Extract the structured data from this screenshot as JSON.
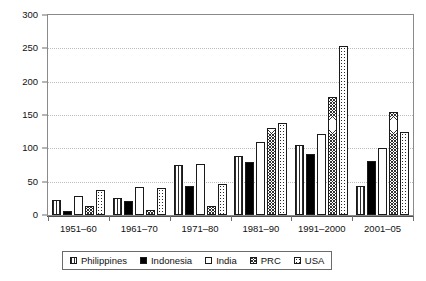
{
  "chart_data": {
    "type": "bar",
    "title": "",
    "xlabel": "",
    "ylabel": "",
    "ylim": [
      0,
      300
    ],
    "yticks": [
      0,
      50,
      100,
      150,
      200,
      250,
      300
    ],
    "ytick_labels": [
      "0",
      "50",
      "100",
      "150",
      "200",
      "250",
      "300"
    ],
    "grid": true,
    "legend_position": "bottom",
    "categories": [
      "1951–60",
      "1961–70",
      "1971–80",
      "1981–90",
      "1991–2000",
      "2001–05"
    ],
    "series": [
      {
        "name": "Philippines",
        "pattern": "vertical-lines",
        "values": [
          22,
          25,
          75,
          89,
          105,
          44
        ]
      },
      {
        "name": "Indonesia",
        "pattern": "solid-black",
        "values": [
          6,
          21,
          43,
          79,
          92,
          81
        ]
      },
      {
        "name": "India",
        "pattern": "white",
        "values": [
          28,
          42,
          77,
          110,
          122,
          100
        ]
      },
      {
        "name": "PRC",
        "pattern": "cross-hatch",
        "values": [
          13,
          7,
          13,
          130,
          177,
          155
        ]
      },
      {
        "name": "USA",
        "pattern": "dotted",
        "values": [
          38,
          41,
          47,
          138,
          254,
          125
        ]
      }
    ]
  },
  "legend": {
    "items": [
      {
        "label": "Philippines"
      },
      {
        "label": "Indonesia"
      },
      {
        "label": "India"
      },
      {
        "label": "PRC"
      },
      {
        "label": "USA"
      }
    ]
  },
  "colors": {
    "frame": "#8a8a8a",
    "grid": "#bdbdbd",
    "text": "#111111",
    "bar_outline": "#1a1a1a",
    "indonesia_fill": "#000000"
  }
}
